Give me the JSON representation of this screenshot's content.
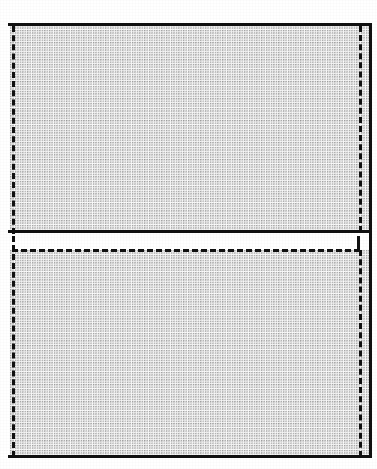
{
  "figure": {
    "kind": "technical-line-drawing",
    "background_color": "#ffffff",
    "line_color": "#111111",
    "fill_color": "#fdfdfd",
    "fill_pattern": "stipple-halftone-dots",
    "canvas": {
      "width": 377,
      "height": 469
    }
  },
  "regions": [
    {
      "id": "upper-region",
      "name": "upper hatched rectangle",
      "x": 10,
      "y": 25,
      "width": 360,
      "height": 207,
      "fill": "stipple"
    },
    {
      "id": "lower-region",
      "name": "lower hatched rectangle",
      "x": 10,
      "y": 250,
      "width": 360,
      "height": 207,
      "fill": "stipple"
    }
  ],
  "gap": {
    "id": "middle-gap",
    "name": "blank separation band",
    "y": 232,
    "height": 18,
    "fill": "#ffffff"
  },
  "solid_lines": [
    {
      "id": "top-edge",
      "name": "top solid boundary",
      "orientation": "horizontal",
      "x1": 8,
      "x2": 372,
      "y": 24
    },
    {
      "id": "middle-edge",
      "name": "middle solid boundary",
      "orientation": "horizontal",
      "x1": 8,
      "x2": 372,
      "y": 231
    },
    {
      "id": "bottom-edge",
      "name": "bottom solid boundary",
      "orientation": "horizontal",
      "x1": 8,
      "x2": 372,
      "y": 456
    },
    {
      "id": "right-edge-upper",
      "name": "right solid boundary upper",
      "orientation": "vertical",
      "y1": 24,
      "y2": 234,
      "x": 369
    },
    {
      "id": "right-edge-lower",
      "name": "right solid boundary lower",
      "orientation": "vertical",
      "y1": 234,
      "y2": 459,
      "x": 369
    }
  ],
  "dashed_lines": [
    {
      "id": "left-dash-upper",
      "name": "left dashed edge upper",
      "orientation": "vertical",
      "x": 12,
      "y1": 26,
      "y2": 234
    },
    {
      "id": "left-dash-lower",
      "name": "left dashed edge lower",
      "orientation": "vertical",
      "x": 12,
      "y1": 236,
      "y2": 457
    },
    {
      "id": "right-dash-upper",
      "name": "right dashed edge upper",
      "orientation": "vertical",
      "x": 359,
      "y1": 26,
      "y2": 232
    },
    {
      "id": "right-dash-lower",
      "name": "right dashed edge lower",
      "orientation": "vertical",
      "x": 359,
      "y1": 250,
      "y2": 457
    },
    {
      "id": "mid-dash",
      "name": "middle dashed rule",
      "orientation": "horizontal",
      "y": 250,
      "x1": 12,
      "x2": 360
    },
    {
      "id": "mid-dash-riser",
      "name": "dashed riser connector",
      "orientation": "vertical",
      "x": 357,
      "y1": 236,
      "y2": 252
    }
  ]
}
